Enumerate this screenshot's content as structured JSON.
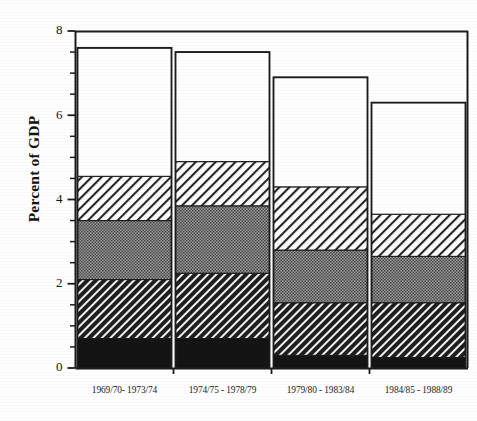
{
  "chart_data": {
    "type": "bar",
    "title": "",
    "subtitle": "",
    "xlabel": "",
    "ylabel": "Percent of GDP",
    "ylim": [
      0,
      8
    ],
    "yticks": [
      0,
      2,
      4,
      6,
      8
    ],
    "ytick_labels": [
      "0",
      "2",
      "4",
      "6",
      "8"
    ],
    "yminor_step": 0.5,
    "grid": false,
    "legend": "none",
    "stacked": true,
    "orientation": "vertical",
    "categories": [
      "1969/70- 1973/74",
      "1974/75 - 1978/79",
      "1979/80 - 1983/84",
      "1984/85 - 1988/89"
    ],
    "series": [
      {
        "name": "segment-1-solid-black",
        "pattern": "solid-black",
        "values": [
          0.7,
          0.7,
          0.3,
          0.25
        ]
      },
      {
        "name": "segment-2-dark-hatch",
        "pattern": "dark-diagonal-hatch",
        "values": [
          1.4,
          1.55,
          1.25,
          1.3
        ]
      },
      {
        "name": "segment-3-gray-stipple",
        "pattern": "gray-stipple",
        "values": [
          1.4,
          1.6,
          1.25,
          1.1
        ]
      },
      {
        "name": "segment-4-light-hatch",
        "pattern": "light-diagonal-hatch",
        "values": [
          1.05,
          1.05,
          1.5,
          1.0
        ]
      },
      {
        "name": "segment-5-white",
        "pattern": "white-unfilled",
        "values": [
          3.05,
          2.6,
          2.6,
          2.65
        ]
      }
    ],
    "cumulative_tops": [
      [
        0.7,
        2.1,
        3.5,
        4.55,
        7.6
      ],
      [
        0.7,
        2.25,
        3.85,
        4.9,
        7.5
      ],
      [
        0.3,
        1.55,
        2.8,
        4.3,
        6.9
      ],
      [
        0.25,
        1.55,
        2.65,
        3.65,
        6.3
      ]
    ],
    "totals": [
      7.6,
      7.5,
      6.9,
      6.3
    ]
  },
  "style": {
    "ink": "#1c1c1c",
    "paper": "#ffffff",
    "stipple_gray": "#8a8a8a"
  }
}
